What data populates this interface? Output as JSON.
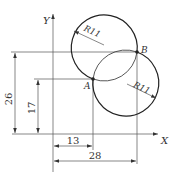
{
  "diagram": {
    "type": "geometric construction drawing",
    "axes": {
      "x_label": "X",
      "y_label": "Y"
    },
    "points": [
      {
        "label": "A",
        "coords": [
          13,
          17
        ]
      },
      {
        "label": "B",
        "coords": [
          28,
          26
        ]
      }
    ],
    "circles": [
      {
        "name": "upper-circle",
        "radius_label": "R11"
      },
      {
        "name": "lower-circle",
        "radius_label": "R11"
      }
    ],
    "dimensions": {
      "horizontal": [
        {
          "label": "13",
          "from": "origin",
          "to": "A"
        },
        {
          "label": "28",
          "from": "origin",
          "to": "B"
        }
      ],
      "vertical": [
        {
          "label": "17",
          "from": "origin",
          "to": "A"
        },
        {
          "label": "26",
          "from": "origin",
          "to": "B"
        }
      ]
    },
    "colors": {
      "line": "#222222",
      "background": "#ffffff"
    }
  }
}
